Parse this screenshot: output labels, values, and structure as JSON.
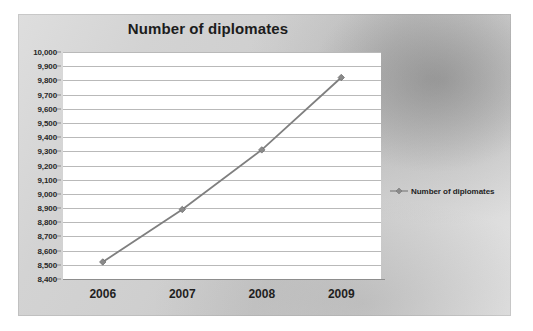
{
  "chart_data": {
    "type": "line",
    "title": "Number of diplomates",
    "xlabel": "",
    "ylabel": "",
    "categories": [
      "2006",
      "2007",
      "2008",
      "2009"
    ],
    "x": [
      2006,
      2007,
      2008,
      2009
    ],
    "series": [
      {
        "name": "Number of diplomates",
        "values": [
          8520,
          8890,
          9310,
          9820
        ],
        "color": "#7f7f7f",
        "marker": "diamond"
      }
    ],
    "ylim": [
      8400,
      10000
    ],
    "ytick_step": 100,
    "ytick_labels": [
      "10,000",
      "9,900",
      "9,800",
      "9,700",
      "9,600",
      "9,500",
      "9,400",
      "9,300",
      "9,200",
      "9,100",
      "9,000",
      "8,900",
      "8,800",
      "8,700",
      "8,600",
      "8,500",
      "8,400"
    ],
    "ytick_values": [
      10000,
      9900,
      9800,
      9700,
      9600,
      9500,
      9400,
      9300,
      9200,
      9100,
      9000,
      8900,
      8800,
      8700,
      8600,
      8500,
      8400
    ],
    "grid": true,
    "grid_axis": "y",
    "legend": {
      "entries": [
        "Number of diplomates"
      ],
      "position": "right"
    },
    "plot_background": "#ffffff",
    "grid_color": "#b9b9b9",
    "axis_color": "#8d8d8d",
    "text_color": "#1f1f1f"
  }
}
